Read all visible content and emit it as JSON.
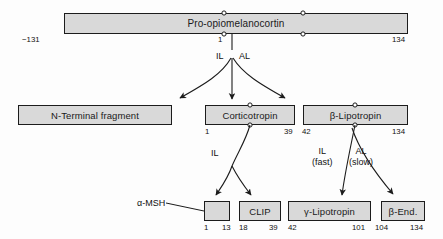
{
  "diagram": {
    "colors": {
      "box_fill": "#d9d9d9",
      "box_border": "#1c1c1c",
      "background": "#fdfdfd",
      "line": "#1c1c1c"
    },
    "rows": [
      {
        "row": "precursor",
        "boxes": [
          {
            "label": "Pro-opiomelanocortin",
            "start": "−131",
            "end": "134",
            "ticks": [
              "1",
              ""
            ]
          }
        ]
      },
      {
        "row": "primary-products",
        "boxes": [
          {
            "label": "N-Terminal fragment",
            "start": "",
            "end": ""
          },
          {
            "label": "Corticotropin",
            "start": "1",
            "end": "39"
          },
          {
            "label": "β-Lipotropin",
            "start": "42",
            "end": "134"
          }
        ]
      },
      {
        "row": "secondary-products",
        "boxes": [
          {
            "label": "",
            "start": "1",
            "end": "13",
            "side_label": "α-MSH"
          },
          {
            "label": "CLIP",
            "start": "18",
            "end": "39"
          },
          {
            "label": "γ-Lipotropin",
            "start": "42",
            "end": "101"
          },
          {
            "label": "β-End.",
            "start": "104",
            "end": "134"
          }
        ]
      }
    ],
    "enzyme_labels": [
      {
        "name": "il-top",
        "text": "IL"
      },
      {
        "name": "al-top",
        "text": "AL"
      },
      {
        "name": "il-corticotropin",
        "text": "IL"
      },
      {
        "name": "il-fast",
        "line1": "IL",
        "line2": "(fast)"
      },
      {
        "name": "al-slow",
        "line1": "AL",
        "line2": "(slow)"
      }
    ]
  }
}
